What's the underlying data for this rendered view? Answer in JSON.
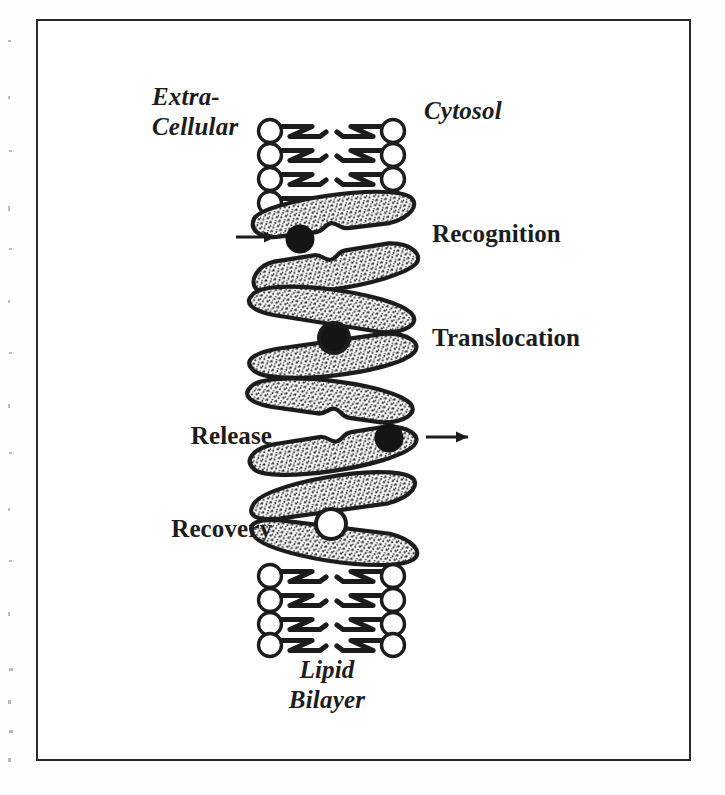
{
  "figure": {
    "kind": "membrane-transport-cycle-diagram",
    "style": "black-and-white scanned line art",
    "frame": {
      "border_color": "#2a2a2a",
      "background": "#ffffff"
    },
    "ink_color": "#1c1c1c"
  },
  "labels": {
    "extracellular": "Extra-\nCellular",
    "extracellular_line1": "Extra-",
    "extracellular_line2": "Cellular",
    "cytosol": "Cytosol",
    "recognition": "Recognition",
    "translocation": "Translocation",
    "release": "Release",
    "recovery": "Recovery",
    "bilayer_line1": "Lipid",
    "bilayer_line2": "Bilayer"
  },
  "stages": [
    {
      "name": "recognition",
      "label": "Recognition",
      "side": "right",
      "arrow": "inbound",
      "substrate": "filled-black-ball",
      "substrate_position": "outside-left-pocket"
    },
    {
      "name": "translocation",
      "label": "Translocation",
      "side": "right",
      "arrow": "none",
      "substrate": "filled-black-ball-ringed",
      "substrate_position": "enclosed-center"
    },
    {
      "name": "release",
      "label": "Release",
      "side": "left",
      "arrow": "outbound",
      "substrate": "filled-black-ball",
      "substrate_position": "outside-right-pocket"
    },
    {
      "name": "recovery",
      "label": "Recovery",
      "side": "left",
      "arrow": "none",
      "substrate": "empty-white-ball",
      "substrate_position": "empty-center-pocket"
    }
  ],
  "membrane": {
    "description": "phospholipid bilayer drawn as two columns of circular head groups with zig-zag acyl tails facing inward",
    "top_rows": 4,
    "bottom_rows": 4,
    "head_shape": "open-circle",
    "tail_shape": "zigzag"
  },
  "carrier": {
    "description": "transport protein rendered as paired stippled lenticular lobes that tilt in alternating directions at each stage",
    "fill": "stippled-grey",
    "outline": "#1c1c1c",
    "lobe_pairs": 4
  }
}
